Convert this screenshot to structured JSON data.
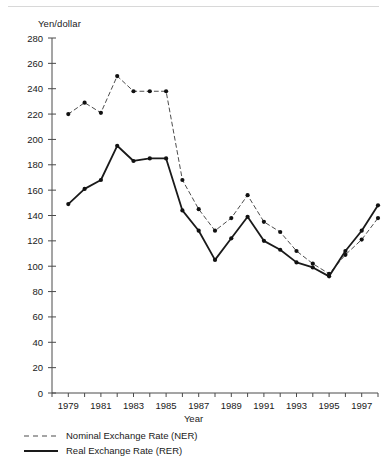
{
  "figure": {
    "y_axis_title": "Yen/dollar",
    "x_axis_title": "Year"
  },
  "legend": {
    "items": [
      {
        "label": "Nominal Exchange Rate (NER)",
        "style": "dashed",
        "color": "#4d4d4d"
      },
      {
        "label": "Real Exchange Rate (RER)",
        "style": "solid",
        "color": "#1a1a1a"
      }
    ]
  },
  "chart_data": {
    "type": "line",
    "title": "",
    "xlabel": "Year",
    "ylabel": "Yen/dollar",
    "xlim": [
      1978,
      1998
    ],
    "ylim": [
      0,
      280
    ],
    "ytick_step": 20,
    "yticks": [
      0,
      20,
      40,
      60,
      80,
      100,
      120,
      140,
      160,
      180,
      200,
      220,
      240,
      260,
      280
    ],
    "xticks_all": [
      1978,
      1979,
      1980,
      1981,
      1982,
      1983,
      1984,
      1985,
      1986,
      1987,
      1988,
      1989,
      1990,
      1991,
      1992,
      1993,
      1994,
      1995,
      1996,
      1997,
      1998
    ],
    "xtick_labels": [
      "1979",
      "1981",
      "1983",
      "1985",
      "1987",
      "1989",
      "1991",
      "1993",
      "1995",
      "1997"
    ],
    "xtick_labeled_years": [
      1979,
      1981,
      1983,
      1985,
      1987,
      1989,
      1991,
      1993,
      1995,
      1997
    ],
    "grid": false,
    "legend_position": "below",
    "x": [
      1979,
      1980,
      1981,
      1982,
      1983,
      1984,
      1985,
      1986,
      1987,
      1988,
      1989,
      1990,
      1991,
      1992,
      1993,
      1994,
      1995,
      1996,
      1997,
      1998
    ],
    "series": [
      {
        "name": "Nominal Exchange Rate (NER)",
        "short": "NER",
        "style": "dashed",
        "color": "#4d4d4d",
        "marker": "circle",
        "values": [
          220,
          229,
          221,
          250,
          238,
          238,
          238,
          168,
          145,
          128,
          138,
          156,
          135,
          127,
          112,
          102,
          94,
          109,
          121,
          138
        ]
      },
      {
        "name": "Real Exchange Rate (RER)",
        "short": "RER",
        "style": "solid",
        "color": "#1a1a1a",
        "marker": "circle",
        "values": [
          149,
          161,
          168,
          195,
          183,
          185,
          185,
          144,
          128,
          105,
          122,
          139,
          120,
          113,
          103,
          99,
          92,
          112,
          128,
          148
        ]
      }
    ]
  }
}
